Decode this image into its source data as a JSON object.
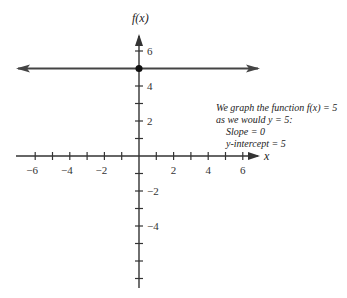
{
  "chart_data": {
    "type": "line",
    "title": "",
    "xlabel": "x",
    "ylabel": "f(x)",
    "xlim": [
      -7,
      7
    ],
    "ylim": [
      -7,
      7
    ],
    "x_ticks": [
      -6,
      -5,
      -4,
      -3,
      -2,
      -1,
      1,
      2,
      3,
      4,
      5,
      6
    ],
    "x_tick_labels": [
      "-6",
      "-4",
      "-2",
      "2",
      "4",
      "6"
    ],
    "y_ticks": [
      -7,
      -6,
      -5,
      -4,
      -3,
      -2,
      -1,
      1,
      2,
      3,
      4,
      5,
      6
    ],
    "y_tick_labels": [
      "6",
      "4",
      "2",
      "-2",
      "-4"
    ],
    "series": [
      {
        "name": "f(x) = 5",
        "x": [
          -7,
          7
        ],
        "y": [
          5,
          5
        ],
        "style": "horizontal line with arrows at both ends"
      }
    ],
    "points": [
      {
        "x": 0,
        "y": 5,
        "label": "y-intercept"
      }
    ],
    "annotations": [
      "We graph the function f(x) = 5",
      "as we would y = 5:",
      "Slope = 0",
      "y-intercept = 5"
    ],
    "grid": false,
    "legend": "none"
  },
  "labels": {
    "x_axis": "x",
    "y_axis": "f(x)",
    "x_ticks": [
      {
        "value": -6,
        "text": "−6"
      },
      {
        "value": -4,
        "text": "−4"
      },
      {
        "value": -2,
        "text": "−2"
      },
      {
        "value": 2,
        "text": "2"
      },
      {
        "value": 4,
        "text": "4"
      },
      {
        "value": 6,
        "text": "6"
      }
    ],
    "y_ticks": [
      {
        "value": 6,
        "text": "6"
      },
      {
        "value": 4,
        "text": "4"
      },
      {
        "value": 2,
        "text": "2"
      },
      {
        "value": -2,
        "text": "−2"
      },
      {
        "value": -4,
        "text": "−4"
      }
    ]
  },
  "note": {
    "line1": "We graph the function f(x) = 5",
    "line2": "as we would y = 5:",
    "line3": "Slope = 0",
    "line4": "y-intercept = 5"
  },
  "colors": {
    "axis": "#333333",
    "line": "#444444",
    "point": "#111111"
  }
}
